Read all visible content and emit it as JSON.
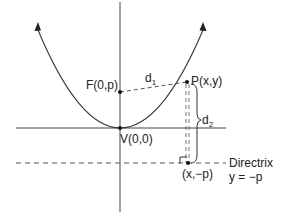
{
  "diagram": {
    "labels": {
      "focus": "F(0,p)",
      "point": "P(x,y)",
      "vertex": "V(0,0)",
      "foot": "(x,−p)",
      "d1_main": "d",
      "d1_sub": "1",
      "d2_main": "d",
      "d2_sub": "2",
      "directrix": "Directrix",
      "directrix_eq": "y = −p"
    },
    "colors": {
      "line": "#333333",
      "background": "#ffffff"
    }
  }
}
